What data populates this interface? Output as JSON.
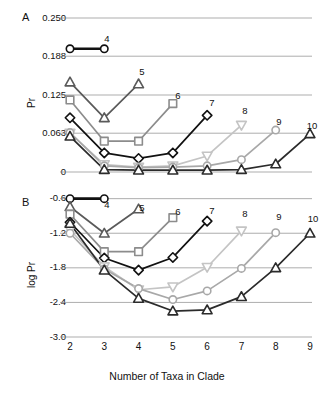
{
  "figure": {
    "xlabel": "Number of Taxa in Clade",
    "panelA_letter": "A",
    "panelB_letter": "B",
    "panelA_ylabel": "Pr",
    "panelB_ylabel": "log Pr"
  },
  "chart_data": [
    {
      "type": "line",
      "panel": "A",
      "title": "",
      "xlabel": "Number of Taxa in Clade",
      "ylabel": "Pr",
      "xlim": [
        2,
        9
      ],
      "ylim": [
        0,
        0.25
      ],
      "xticks": [
        2,
        3,
        4,
        5,
        6,
        7,
        8,
        9
      ],
      "xticklabels": [
        "",
        "",
        "",
        "",
        "",
        "",
        "",
        ""
      ],
      "yticks": [
        0,
        0.063,
        0.125,
        0.188,
        0.25
      ],
      "yticklabels": [
        "0",
        "0.063",
        "0.125",
        "0.188",
        "0.250"
      ],
      "grid": "horizontal",
      "legend": "inline-end-labels",
      "series": [
        {
          "name": "4",
          "color": "#111111",
          "marker": "circle",
          "x": [
            2,
            3
          ],
          "values": [
            0.2,
            0.2
          ]
        },
        {
          "name": "5",
          "color": "#5a5a5a",
          "marker": "triangle",
          "x": [
            2,
            3,
            4
          ],
          "values": [
            0.146,
            0.088,
            0.143
          ]
        },
        {
          "name": "6",
          "color": "#8c8c8c",
          "marker": "square",
          "x": [
            2,
            3,
            4,
            5
          ],
          "values": [
            0.117,
            0.05,
            0.05,
            0.111
          ]
        },
        {
          "name": "7",
          "color": "#111111",
          "marker": "diamond",
          "x": [
            2,
            3,
            4,
            5,
            6
          ],
          "values": [
            0.088,
            0.031,
            0.022,
            0.031,
            0.092
          ]
        },
        {
          "name": "8",
          "color": "#c4c4c4",
          "marker": "triangle-down",
          "x": [
            2,
            3,
            4,
            5,
            6,
            7
          ],
          "values": [
            0.063,
            0.012,
            0.008,
            0.01,
            0.026,
            0.076
          ]
        },
        {
          "name": "9",
          "color": "#a8a8a8",
          "marker": "circle",
          "x": [
            2,
            3,
            4,
            5,
            6,
            7,
            8
          ],
          "values": [
            0.064,
            0.01,
            0.007,
            0.008,
            0.01,
            0.02,
            0.068
          ]
        },
        {
          "name": "10",
          "color": "#2b2b2b",
          "marker": "triangle",
          "x": [
            2,
            3,
            4,
            5,
            6,
            7,
            8,
            9
          ],
          "values": [
            0.058,
            0.004,
            0.003,
            0.003,
            0.003,
            0.004,
            0.013,
            0.062
          ]
        }
      ]
    },
    {
      "type": "line",
      "panel": "B",
      "title": "",
      "xlabel": "Number of Taxa in Clade",
      "ylabel": "log Pr",
      "xlim": [
        2,
        9
      ],
      "ylim": [
        -3.0,
        -0.45
      ],
      "xticks": [
        2,
        3,
        4,
        5,
        6,
        7,
        8,
        9
      ],
      "xticklabels": [
        "2",
        "3",
        "4",
        "5",
        "6",
        "7",
        "8",
        "9"
      ],
      "yticks": [
        -3.0,
        -2.4,
        -1.8,
        -1.2,
        -0.6
      ],
      "yticklabels": [
        "-3.0",
        "-2.4",
        "-1.8",
        "-1.2",
        "-0.6"
      ],
      "grid": "horizontal",
      "legend": "inline-end-labels",
      "series": [
        {
          "name": "4",
          "color": "#111111",
          "marker": "circle",
          "x": [
            2,
            3
          ],
          "values": [
            -0.6,
            -0.6
          ]
        },
        {
          "name": "5",
          "color": "#5a5a5a",
          "marker": "triangle",
          "x": [
            2,
            3,
            4
          ],
          "values": [
            -0.74,
            -1.2,
            -0.78
          ]
        },
        {
          "name": "6",
          "color": "#8c8c8c",
          "marker": "square",
          "x": [
            2,
            3,
            4,
            5
          ],
          "values": [
            -0.87,
            -1.52,
            -1.52,
            -0.93
          ]
        },
        {
          "name": "7",
          "color": "#111111",
          "marker": "diamond",
          "x": [
            2,
            3,
            4,
            5,
            6
          ],
          "values": [
            -1.01,
            -1.63,
            -1.84,
            -1.62,
            -0.99
          ]
        },
        {
          "name": "8",
          "color": "#c4c4c4",
          "marker": "triangle-down",
          "x": [
            2,
            3,
            4,
            5,
            6,
            7
          ],
          "values": [
            -1.14,
            -1.78,
            -2.18,
            -2.13,
            -1.79,
            -1.16
          ]
        },
        {
          "name": "9",
          "color": "#a8a8a8",
          "marker": "circle",
          "x": [
            2,
            3,
            4,
            5,
            6,
            7,
            8
          ],
          "values": [
            -1.2,
            -1.82,
            -2.16,
            -2.35,
            -2.2,
            -1.81,
            -1.19
          ]
        },
        {
          "name": "10",
          "color": "#2b2b2b",
          "marker": "triangle",
          "x": [
            2,
            3,
            4,
            5,
            6,
            7,
            8,
            9
          ],
          "values": [
            -1.03,
            -1.84,
            -2.33,
            -2.55,
            -2.53,
            -2.3,
            -1.8,
            -1.2
          ]
        }
      ]
    }
  ],
  "series_labels": [
    {
      "text": "4",
      "panel": "A",
      "x": 107,
      "y": 33
    },
    {
      "text": "5",
      "panel": "A",
      "x": 142,
      "y": 66
    },
    {
      "text": "6",
      "panel": "A",
      "x": 178,
      "y": 90
    },
    {
      "text": "7",
      "panel": "A",
      "x": 212,
      "y": 97
    },
    {
      "text": "8",
      "panel": "A",
      "x": 245,
      "y": 105
    },
    {
      "text": "9",
      "panel": "A",
      "x": 279,
      "y": 116
    },
    {
      "text": "10",
      "panel": "A",
      "x": 312,
      "y": 120
    }
  ],
  "series_labels_b": [
    {
      "text": "4",
      "x": 107,
      "y": 199
    },
    {
      "text": "5",
      "x": 142,
      "y": 202
    },
    {
      "text": "6",
      "x": 178,
      "y": 206
    },
    {
      "text": "7",
      "x": 212,
      "y": 205
    },
    {
      "text": "8",
      "x": 245,
      "y": 208
    },
    {
      "text": "9",
      "x": 279,
      "y": 211
    },
    {
      "text": "10",
      "x": 313,
      "y": 213
    }
  ]
}
